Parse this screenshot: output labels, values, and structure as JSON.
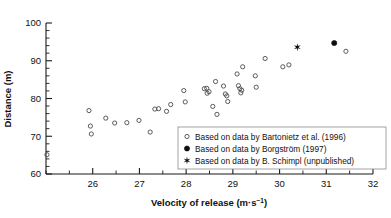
{
  "chart_data": {
    "type": "scatter",
    "title": "",
    "xlabel": "Velocity of release (m·s⁻¹)",
    "ylabel": "Distance (m)",
    "xlim": [
      25,
      32
    ],
    "ylim": [
      60,
      100
    ],
    "xticks": [
      26,
      27,
      28,
      29,
      30,
      31,
      32
    ],
    "yticks": [
      60,
      70,
      80,
      90,
      100
    ],
    "x_minor_step": 0.5,
    "y_minor_step": 2,
    "grid": false,
    "legend_position": "lower right",
    "series": [
      {
        "name": "Based on data by Bartonietz et al. (1996)",
        "marker": "open-circle",
        "color": "#4a4a4a",
        "points": [
          [
            25.02,
            65.1
          ],
          [
            25.92,
            76.8
          ],
          [
            25.95,
            72.7
          ],
          [
            25.97,
            70.6
          ],
          [
            26.28,
            74.8
          ],
          [
            26.47,
            73.5
          ],
          [
            26.73,
            73.6
          ],
          [
            26.99,
            74.2
          ],
          [
            27.23,
            71.1
          ],
          [
            27.33,
            77.2
          ],
          [
            27.41,
            77.3
          ],
          [
            27.58,
            76.6
          ],
          [
            27.67,
            78.4
          ],
          [
            27.95,
            82.1
          ],
          [
            27.98,
            79.1
          ],
          [
            28.39,
            82.6
          ],
          [
            28.44,
            82.7
          ],
          [
            28.45,
            81.4
          ],
          [
            28.49,
            81.8
          ],
          [
            28.57,
            77.9
          ],
          [
            28.63,
            84.5
          ],
          [
            28.66,
            75.8
          ],
          [
            28.8,
            83.3
          ],
          [
            28.84,
            81.2
          ],
          [
            28.87,
            80.7
          ],
          [
            28.89,
            79.2
          ],
          [
            29.09,
            86.5
          ],
          [
            29.12,
            83.4
          ],
          [
            29.15,
            82.6
          ],
          [
            29.17,
            81.5
          ],
          [
            29.19,
            82.2
          ],
          [
            29.21,
            88.4
          ],
          [
            29.48,
            86.0
          ],
          [
            29.5,
            83.0
          ],
          [
            29.69,
            90.6
          ],
          [
            30.07,
            88.4
          ],
          [
            30.2,
            88.9
          ],
          [
            31.42,
            92.5
          ]
        ]
      },
      {
        "name": "Based on data by Borgström (1997)",
        "marker": "filled-circle",
        "color": "#0d0d0d",
        "points": [
          [
            31.17,
            94.7
          ]
        ]
      },
      {
        "name": "Based on data by B. Schimpl (unpublished)",
        "marker": "star",
        "color": "#0d0d0d",
        "points": [
          [
            30.38,
            93.6
          ]
        ]
      }
    ]
  },
  "legend": {
    "entries": [
      {
        "marker": "open-circle",
        "label": "Based on data by Bartonietz et al. (1996)"
      },
      {
        "marker": "filled-circle",
        "label": "Based on data by Borgström (1997)"
      },
      {
        "marker": "star",
        "label": "Based on data by B. Schimpl (unpublished)"
      }
    ]
  },
  "axis_label_parts": {
    "x_prefix": "Velocity of release (m·s",
    "x_superscript": "−1",
    "x_suffix": ")",
    "y_full": "Distance (m)"
  }
}
